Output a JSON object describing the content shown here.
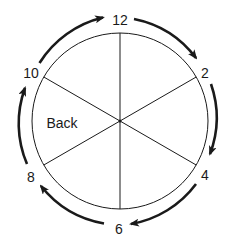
{
  "diagram": {
    "type": "cyclic-position-wheel",
    "center": {
      "x": 120,
      "y": 121
    },
    "inner_radius": 88,
    "arrow_radius": 103,
    "colors": {
      "stroke": "#1a1a1a",
      "text": "#1a1a1a",
      "background": "#ffffff"
    },
    "positions": [
      {
        "label": "12",
        "angle_deg": 0
      },
      {
        "label": "2",
        "angle_deg": 60
      },
      {
        "label": "4",
        "angle_deg": 120
      },
      {
        "label": "6",
        "angle_deg": 180
      },
      {
        "label": "8",
        "angle_deg": 240
      },
      {
        "label": "10",
        "angle_deg": 300
      }
    ],
    "region_label": "Back",
    "arrow_direction": "clockwise",
    "arrows": [
      {
        "from": "10",
        "to": "12"
      },
      {
        "from": "12",
        "to": "2"
      },
      {
        "from": "2",
        "to": "4"
      },
      {
        "from": "4",
        "to": "6"
      },
      {
        "from": "6",
        "to": "8"
      },
      {
        "from": "8",
        "to": "10"
      }
    ]
  }
}
